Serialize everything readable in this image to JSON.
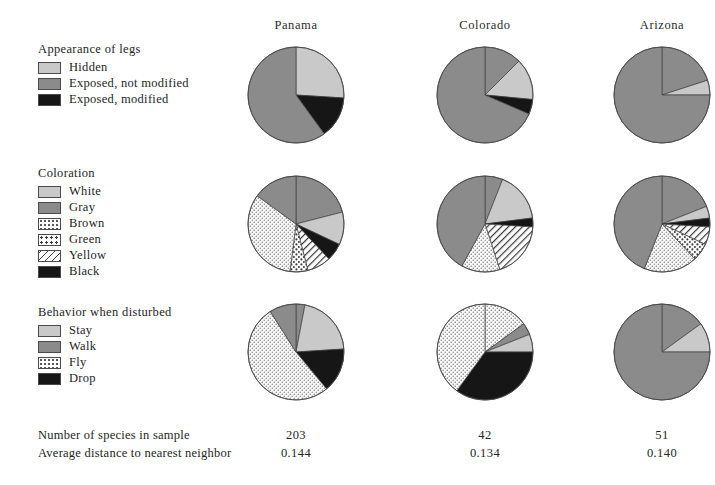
{
  "figure": {
    "columns": [
      {
        "name": "Panama",
        "cx": 296,
        "header_left": 216
      },
      {
        "name": "Colorado",
        "cx": 485,
        "header_left": 405
      },
      {
        "name": "Arizona",
        "cx": 662,
        "header_left": 582
      }
    ],
    "palette": {
      "light_gray": "#c9c9c9",
      "dark_gray": "#8b8b8b",
      "black": "#161616",
      "white_fill": "#ffffff",
      "outline": "#4a4a4a"
    }
  },
  "legends": [
    {
      "title": "Appearance of legs",
      "top": 42,
      "items": [
        {
          "label": "Hidden",
          "fill": "light"
        },
        {
          "label": "Exposed, not modified",
          "fill": "dark"
        },
        {
          "label": "Exposed, modified",
          "fill": "black"
        }
      ]
    },
    {
      "title": "Coloration",
      "top": 166,
      "items": [
        {
          "label": "White",
          "fill": "white"
        },
        {
          "label": "Gray",
          "fill": "dark"
        },
        {
          "label": "Brown",
          "fill": "brown"
        },
        {
          "label": "Green",
          "fill": "green"
        },
        {
          "label": "Yellow",
          "fill": "yellow"
        },
        {
          "label": "Black",
          "fill": "black"
        }
      ]
    },
    {
      "title": "Behavior when disturbed",
      "top": 305,
      "items": [
        {
          "label": "Stay",
          "fill": "light"
        },
        {
          "label": "Walk",
          "fill": "dark"
        },
        {
          "label": "Fly",
          "fill": "brown"
        },
        {
          "label": "Drop",
          "fill": "black"
        }
      ]
    }
  ],
  "footer": {
    "rows": [
      {
        "label": "Number of species in sample",
        "top": 428,
        "values": [
          "203",
          "42",
          "51"
        ]
      },
      {
        "label": "Average distance to nearest neighbor",
        "top": 446,
        "values": [
          "0.144",
          "0.134",
          "0.140"
        ]
      }
    ]
  },
  "chart_data": {
    "type": "pie",
    "title": "",
    "note": "3x3 matrix of pie charts; rows are attributes, columns are localities. Values are percentages of species in sample.",
    "row_order": [
      "Appearance of legs",
      "Coloration",
      "Behavior when disturbed"
    ],
    "column_order": [
      "Panama",
      "Colorado",
      "Arizona"
    ],
    "charts": [
      {
        "row": "Appearance of legs",
        "column": "Panama",
        "cx": 296,
        "cy": 95,
        "r": 48,
        "slices": [
          {
            "label": "Hidden",
            "fill": "light",
            "value": 26
          },
          {
            "label": "Exposed, modified",
            "fill": "black",
            "value": 14
          },
          {
            "label": "Exposed, not modified",
            "fill": "dark",
            "value": 60
          }
        ]
      },
      {
        "row": "Appearance of legs",
        "column": "Colorado",
        "cx": 485,
        "cy": 95,
        "r": 48,
        "slices": [
          {
            "label": "Exposed, not modified",
            "fill": "dark",
            "value": 12.5
          },
          {
            "label": "Hidden",
            "fill": "light",
            "value": 14
          },
          {
            "label": "Exposed, modified",
            "fill": "black",
            "value": 5
          },
          {
            "label": "Exposed, not modified",
            "fill": "dark",
            "value": 68.5
          }
        ]
      },
      {
        "row": "Appearance of legs",
        "column": "Arizona",
        "cx": 662,
        "cy": 95,
        "r": 48,
        "slices": [
          {
            "label": "Exposed, not modified",
            "fill": "dark",
            "value": 20
          },
          {
            "label": "Hidden",
            "fill": "light",
            "value": 5
          },
          {
            "label": "Exposed, not modified",
            "fill": "dark",
            "value": 75
          }
        ]
      },
      {
        "row": "Coloration",
        "column": "Panama",
        "cx": 296,
        "cy": 224,
        "r": 48,
        "slices": [
          {
            "label": "Gray",
            "fill": "dark",
            "value": 21
          },
          {
            "label": "White",
            "fill": "white",
            "value": 11
          },
          {
            "label": "Black",
            "fill": "black",
            "value": 6
          },
          {
            "label": "Yellow",
            "fill": "yellow",
            "value": 8
          },
          {
            "label": "Green",
            "fill": "green",
            "value": 6
          },
          {
            "label": "Brown",
            "fill": "brown",
            "value": 33
          },
          {
            "label": "Gray",
            "fill": "dark",
            "value": 15
          }
        ]
      },
      {
        "row": "Coloration",
        "column": "Colorado",
        "cx": 485,
        "cy": 224,
        "r": 48,
        "slices": [
          {
            "label": "Gray",
            "fill": "dark",
            "value": 6
          },
          {
            "label": "White",
            "fill": "white",
            "value": 17
          },
          {
            "label": "Black",
            "fill": "black",
            "value": 3
          },
          {
            "label": "Yellow",
            "fill": "yellow",
            "value": 19
          },
          {
            "label": "Brown",
            "fill": "brown",
            "value": 13
          },
          {
            "label": "Gray",
            "fill": "dark",
            "value": 42
          }
        ]
      },
      {
        "row": "Coloration",
        "column": "Arizona",
        "cx": 662,
        "cy": 224,
        "r": 48,
        "slices": [
          {
            "label": "Gray",
            "fill": "dark",
            "value": 19
          },
          {
            "label": "White",
            "fill": "white",
            "value": 4
          },
          {
            "label": "Black",
            "fill": "black",
            "value": 3
          },
          {
            "label": "Yellow",
            "fill": "yellow",
            "value": 6
          },
          {
            "label": "Green",
            "fill": "green",
            "value": 6
          },
          {
            "label": "Brown",
            "fill": "brown",
            "value": 18
          },
          {
            "label": "Gray",
            "fill": "dark",
            "value": 44
          }
        ]
      },
      {
        "row": "Behavior when disturbed",
        "column": "Panama",
        "cx": 296,
        "cy": 352,
        "r": 48,
        "slices": [
          {
            "label": "Walk",
            "fill": "dark",
            "value": 3
          },
          {
            "label": "Stay",
            "fill": "light",
            "value": 21
          },
          {
            "label": "Drop",
            "fill": "black",
            "value": 15
          },
          {
            "label": "Fly",
            "fill": "brown",
            "value": 52
          },
          {
            "label": "Walk",
            "fill": "dark",
            "value": 9
          }
        ]
      },
      {
        "row": "Behavior when disturbed",
        "column": "Colorado",
        "cx": 485,
        "cy": 352,
        "r": 48,
        "slices": [
          {
            "label": "Fly",
            "fill": "brown",
            "value": 15
          },
          {
            "label": "Walk",
            "fill": "dark",
            "value": 4
          },
          {
            "label": "Stay",
            "fill": "light",
            "value": 6
          },
          {
            "label": "Drop",
            "fill": "black",
            "value": 35
          },
          {
            "label": "Fly",
            "fill": "brown",
            "value": 40
          }
        ]
      },
      {
        "row": "Behavior when disturbed",
        "column": "Arizona",
        "cx": 662,
        "cy": 352,
        "r": 48,
        "slices": [
          {
            "label": "Walk",
            "fill": "dark",
            "value": 15
          },
          {
            "label": "Stay",
            "fill": "light",
            "value": 10
          },
          {
            "label": "Walk",
            "fill": "dark",
            "value": 75
          }
        ]
      }
    ]
  }
}
